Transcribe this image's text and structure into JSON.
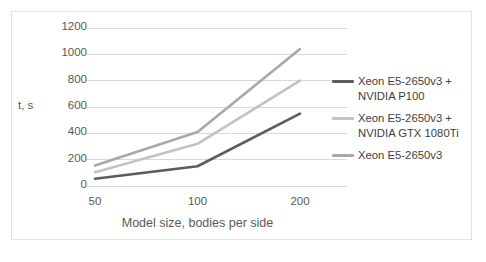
{
  "chart_data": {
    "type": "line",
    "title": "",
    "xlabel": "Model size, bodies per side",
    "ylabel": "t, s",
    "categories": [
      "50",
      "100",
      "200"
    ],
    "ylim": [
      0,
      1200
    ],
    "yticks": [
      "0",
      "200",
      "400",
      "600",
      "800",
      "1000",
      "1200"
    ],
    "ytick_values": [
      0,
      200,
      400,
      600,
      800,
      1000,
      1200
    ],
    "grid": true,
    "legend_position": "right",
    "series": [
      {
        "name": "Xeon E5-2650v3 +\nNVIDIA P100",
        "color": "#5c5c5c",
        "values": [
          55,
          150,
          550
        ]
      },
      {
        "name": "Xeon E5-2650v3 +\nNVIDIA GTX 1080Ti",
        "color": "#c2c2c2",
        "values": [
          105,
          320,
          800
        ]
      },
      {
        "name": "Xeon E5-2650v3",
        "color": "#a8a8a8",
        "values": [
          155,
          410,
          1040
        ]
      }
    ]
  },
  "colors": {
    "border": "#e2e2e2",
    "gridline": "#d9d9d9",
    "tick_text": "#595959",
    "legend_text": "#404040",
    "background": "#ffffff"
  }
}
